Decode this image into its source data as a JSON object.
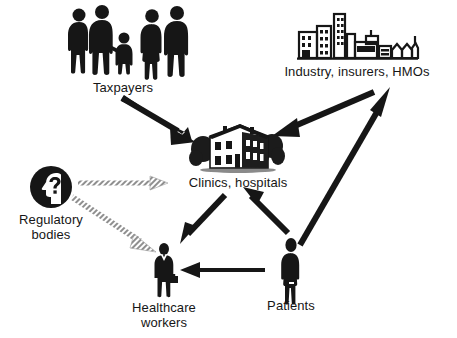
{
  "figure": {
    "width": 457,
    "height": 338,
    "background": "#ffffff",
    "ink": "#161616",
    "accent_grey": "#9a9a9a"
  },
  "nodes": [
    {
      "id": "taxpayers",
      "label": "Taxpayers",
      "icon": "people-group-icon",
      "icon_description": "Five black human silhouettes: a family of three and two adults",
      "label_lines": [
        "Taxpayers"
      ]
    },
    {
      "id": "industry",
      "label": "Industry, insurers, HMOs",
      "icon": "city-skyline-icon",
      "icon_description": "Black outlined city skyline with office towers, factory and small houses",
      "label_lines": [
        "Industry, insurers, HMOs"
      ]
    },
    {
      "id": "clinics",
      "label": "Clinics, hospitals",
      "icon": "hospital-building-icon",
      "icon_description": "Woodcut style two story building flanked by trees",
      "label_lines": [
        "Clinics, hospitals"
      ]
    },
    {
      "id": "regulatory",
      "label": "Regulatory bodies",
      "icon": "head-question-circle-icon",
      "icon_description": "Black circle containing a white head profile with a question mark",
      "label_lines": [
        "Regulatory",
        "bodies"
      ]
    },
    {
      "id": "healthcare-workers",
      "label": "Healthcare workers",
      "icon": "worker-suit-icon",
      "icon_description": "Black silhouette of a person in a suit holding a briefcase",
      "label_lines": [
        "Healthcare",
        "workers"
      ]
    },
    {
      "id": "patients",
      "label": "Patients",
      "icon": "person-standing-icon",
      "icon_description": "Black silhouette of a single standing person",
      "label_lines": [
        "Patients"
      ]
    }
  ],
  "arrows": [
    {
      "id": "taxpayers-to-clinics",
      "from": "taxpayers",
      "to": "clinics",
      "style": "solid-black",
      "direction": "one-way"
    },
    {
      "id": "industry-to-clinics",
      "from": "industry",
      "to": "clinics",
      "style": "solid-black",
      "direction": "one-way"
    },
    {
      "id": "patients-to-industry",
      "from": "patients",
      "to": "industry",
      "style": "solid-black",
      "direction": "one-way"
    },
    {
      "id": "patients-to-clinics",
      "from": "patients",
      "to": "clinics",
      "style": "solid-black",
      "direction": "one-way"
    },
    {
      "id": "clinics-to-healthcare-workers",
      "from": "clinics",
      "to": "healthcare-workers",
      "style": "solid-black",
      "direction": "one-way"
    },
    {
      "id": "patients-to-healthcare-workers",
      "from": "patients",
      "to": "healthcare-workers",
      "style": "solid-black-thin",
      "direction": "one-way"
    },
    {
      "id": "regulatory-to-clinics",
      "from": "regulatory",
      "to": "clinics",
      "style": "hatched-grey",
      "direction": "one-way"
    },
    {
      "id": "regulatory-to-healthcare-workers",
      "from": "regulatory",
      "to": "healthcare-workers",
      "style": "hatched-grey",
      "direction": "one-way"
    }
  ]
}
